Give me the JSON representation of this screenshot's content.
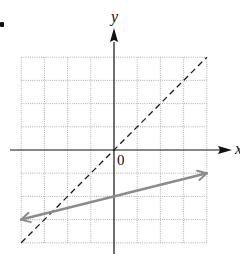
{
  "chart_data": {
    "type": "line",
    "title": "",
    "xlabel": "x",
    "ylabel": "y",
    "origin_label": "0",
    "xlim": [
      -4,
      4
    ],
    "ylim": [
      -4,
      4
    ],
    "grid": true,
    "grid_style": "dotted",
    "tick_labels": [],
    "series": [
      {
        "name": "y = x",
        "style": "dashed",
        "color": "#1a1a1a",
        "x": [
          -4,
          4
        ],
        "y": [
          -4,
          4
        ],
        "arrows": false
      },
      {
        "name": "y = x/4 - 2",
        "style": "solid",
        "color": "#8c8c8c",
        "x": [
          -4,
          4
        ],
        "y": [
          -3,
          -1
        ],
        "arrows": true
      }
    ],
    "annotations": [
      {
        "text": "0",
        "x": 0,
        "y": 0,
        "position": "below-right"
      }
    ],
    "legend": null
  },
  "colors": {
    "axis": "#111111",
    "grid": "#9a9a9a",
    "dashed_line": "#1a1a1a",
    "gray_line": "#8c8c8c"
  }
}
